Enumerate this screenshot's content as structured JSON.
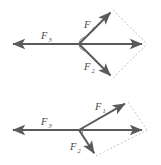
{
  "figure": {
    "name": "force-vector-parallelogram-pair",
    "background_color": "#ffffff",
    "vector_color": "#5a5a5a",
    "dashed_color": "#b9b2b2",
    "label_color": "#4a4a4a",
    "width": 161,
    "height": 165
  },
  "diagrams": [
    {
      "id": "top-diagram",
      "name": "upper-force-diagram",
      "origin": {
        "x": 79,
        "y": 44
      },
      "angle_arc_radius": 7,
      "vectors": [
        {
          "name": "f1-vector",
          "label": "F",
          "subscript": "1",
          "from": {
            "x": 79,
            "y": 44
          },
          "to": {
            "x": 113,
            "y": 10
          },
          "label_pos": {
            "x": 84,
            "y": 24
          }
        },
        {
          "name": "f2-vector",
          "label": "F",
          "subscript": "2",
          "from": {
            "x": 79,
            "y": 44
          },
          "to": {
            "x": 113,
            "y": 78
          },
          "label_pos": {
            "x": 84,
            "y": 68
          }
        },
        {
          "name": "f3-vector",
          "label": "F",
          "subscript": "3",
          "from": {
            "x": 79,
            "y": 44
          },
          "to": {
            "x": 9,
            "y": 44
          },
          "label_pos": {
            "x": 41,
            "y": 36
          }
        },
        {
          "name": "resultant-vector",
          "label": "",
          "subscript": "",
          "from": {
            "x": 79,
            "y": 44
          },
          "to": {
            "x": 146,
            "y": 44
          },
          "label_pos": {
            "x": 0,
            "y": 0
          }
        }
      ],
      "construction_lines": [
        {
          "name": "dashed-f1-to-resultant",
          "from": {
            "x": 113,
            "y": 10
          },
          "to": {
            "x": 147,
            "y": 44
          }
        },
        {
          "name": "dashed-f2-to-resultant",
          "from": {
            "x": 113,
            "y": 78
          },
          "to": {
            "x": 147,
            "y": 44
          }
        }
      ]
    },
    {
      "id": "bottom-diagram",
      "name": "lower-force-diagram",
      "origin": {
        "x": 79,
        "y": 130
      },
      "angle_arc_radius": 7,
      "vectors": [
        {
          "name": "f1-vector",
          "label": "F",
          "subscript": "1",
          "from": {
            "x": 79,
            "y": 130
          },
          "to": {
            "x": 128,
            "y": 102
          },
          "label_pos": {
            "x": 95,
            "y": 107
          }
        },
        {
          "name": "f2-vector",
          "label": "F",
          "subscript": "2",
          "from": {
            "x": 79,
            "y": 130
          },
          "to": {
            "x": 96,
            "y": 156
          },
          "label_pos": {
            "x": 73,
            "y": 148
          }
        },
        {
          "name": "f3-vector",
          "label": "F",
          "subscript": "3",
          "from": {
            "x": 79,
            "y": 130
          },
          "to": {
            "x": 9,
            "y": 130
          },
          "label_pos": {
            "x": 41,
            "y": 122
          }
        },
        {
          "name": "resultant-vector",
          "label": "",
          "subscript": "",
          "from": {
            "x": 79,
            "y": 130
          },
          "to": {
            "x": 146,
            "y": 130
          },
          "label_pos": {
            "x": 0,
            "y": 0
          }
        }
      ],
      "construction_lines": [
        {
          "name": "dashed-f1-to-resultant",
          "from": {
            "x": 128,
            "y": 102
          },
          "to": {
            "x": 147,
            "y": 130
          }
        },
        {
          "name": "dashed-f2-to-resultant",
          "from": {
            "x": 96,
            "y": 156
          },
          "to": {
            "x": 147,
            "y": 130
          }
        }
      ]
    }
  ]
}
